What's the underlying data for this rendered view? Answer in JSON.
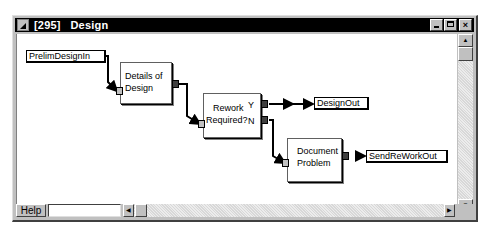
{
  "window": {
    "title": "[295]   Design",
    "buttons": {
      "minimize": "_",
      "maximize": "□",
      "close": "×"
    }
  },
  "diagram": {
    "inputs": [
      {
        "id": "prelim-design-in",
        "label": "PrelimDesignIn"
      }
    ],
    "processes": [
      {
        "id": "details-of-design",
        "label_line1": "Details of",
        "label_line2": "Design"
      },
      {
        "id": "rework-required",
        "label_line1": "Rework",
        "label_line2": "Required?",
        "port_yes": "Y",
        "port_no": "N"
      },
      {
        "id": "document-problem",
        "label_line1": "Document",
        "label_line2": "Problem"
      }
    ],
    "outputs": [
      {
        "id": "design-out",
        "label": "DesignOut"
      },
      {
        "id": "send-rework-out",
        "label": "SendReWorkOut"
      }
    ],
    "connections": [
      [
        "PrelimDesignIn",
        "Details of Design"
      ],
      [
        "Details of Design",
        "Rework Required?"
      ],
      [
        "Rework Required? (Y)",
        "DesignOut"
      ],
      [
        "Rework Required? (N)",
        "Document Problem"
      ],
      [
        "Document Problem",
        "SendReWorkOut"
      ]
    ]
  },
  "bottombar": {
    "help_label": "Help",
    "status_value": ""
  },
  "scroll": {
    "up": "▲",
    "down": "▼",
    "left": "◀",
    "right": "▶"
  }
}
